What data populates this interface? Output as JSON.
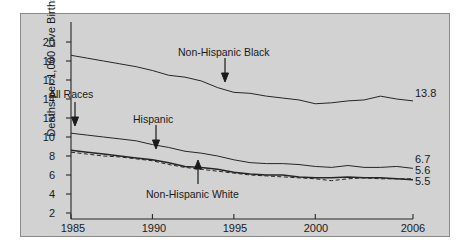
{
  "chart_data": {
    "type": "line",
    "title": "",
    "xlabel": "",
    "ylabel": "Deaths per 1,000 Live Births",
    "xlim": [
      1985,
      2006
    ],
    "ylim": [
      0,
      20
    ],
    "yticks": [
      2,
      4,
      6,
      8,
      10,
      12,
      14,
      16,
      18,
      20
    ],
    "xticks": [
      1985,
      1990,
      1995,
      2000,
      2006
    ],
    "grid": false,
    "legend_position": "inline-annotations",
    "x": [
      1985,
      1986,
      1987,
      1988,
      1989,
      1990,
      1991,
      1992,
      1993,
      1994,
      1995,
      1996,
      1997,
      1998,
      1999,
      2000,
      2001,
      2002,
      2003,
      2004,
      2005,
      2006
    ],
    "series": [
      {
        "name": "Non-Hispanic Black",
        "style": "solid",
        "end_value": 13.8,
        "values": [
          18.6,
          18.3,
          18.0,
          17.7,
          17.4,
          17.0,
          16.5,
          16.3,
          15.9,
          15.2,
          14.7,
          14.6,
          14.3,
          14.1,
          13.9,
          13.5,
          13.6,
          13.8,
          13.9,
          14.3,
          14.0,
          13.8
        ]
      },
      {
        "name": "All Races",
        "style": "solid",
        "end_value": 6.7,
        "values": [
          10.4,
          10.2,
          10.0,
          9.8,
          9.6,
          9.2,
          8.9,
          8.5,
          8.3,
          8.0,
          7.6,
          7.3,
          7.2,
          7.2,
          7.1,
          6.9,
          6.8,
          7.0,
          6.8,
          6.8,
          6.9,
          6.7
        ]
      },
      {
        "name": "Hispanic",
        "style": "dashed",
        "end_value": 5.6,
        "values": [
          8.4,
          8.2,
          8.0,
          7.9,
          7.7,
          7.5,
          7.1,
          6.8,
          6.6,
          6.4,
          6.2,
          6.0,
          5.9,
          5.8,
          5.7,
          5.6,
          5.4,
          5.6,
          5.7,
          5.6,
          5.6,
          5.6
        ]
      },
      {
        "name": "Non-Hispanic White",
        "style": "solid",
        "end_value": 5.5,
        "values": [
          8.6,
          8.4,
          8.2,
          8.0,
          7.8,
          7.6,
          7.3,
          6.9,
          6.8,
          6.6,
          6.3,
          6.1,
          6.0,
          6.0,
          5.8,
          5.7,
          5.7,
          5.8,
          5.7,
          5.7,
          5.6,
          5.5
        ]
      }
    ],
    "annotations": [
      {
        "text": "Non-Hispanic Black",
        "points_to": "Non-Hispanic Black"
      },
      {
        "text": "All Races",
        "points_to": "All Races"
      },
      {
        "text": "Hispanic",
        "points_to": "Hispanic"
      },
      {
        "text": "Non-Hispanic White",
        "points_to": "Non-Hispanic White"
      }
    ],
    "end_labels": [
      "13.8",
      "6.7",
      "5.6",
      "5.5"
    ]
  },
  "axis": {
    "y_title": "Deaths per 1,000 Live Births",
    "y_ticks": [
      "20",
      "18",
      "16",
      "14",
      "12",
      "10",
      "8",
      "6",
      "4",
      "2"
    ],
    "x_ticks": [
      "1985",
      "1990",
      "1995",
      "2000",
      "2006"
    ]
  },
  "labels": {
    "nh_black": "Non-Hispanic Black",
    "all_races": "All Races",
    "hispanic": "Hispanic",
    "nh_white": "Non-Hispanic White",
    "end_black": "13.8",
    "end_all": "6.7",
    "end_hispanic": "5.6",
    "end_white": "5.5"
  },
  "colors": {
    "panel_bg": "#d2d2d2",
    "ink": "#1a1a1a",
    "line": "#262626"
  }
}
